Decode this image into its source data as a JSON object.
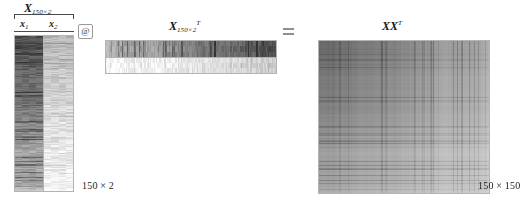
{
  "figure": {
    "kind": "matrix-multiplication-diagram"
  },
  "left_matrix": {
    "name": "X",
    "header_var": "X",
    "header_subscript": "150×2",
    "columns": [
      {
        "var": "x",
        "subscript": "1"
      },
      {
        "var": "x",
        "subscript": "2"
      }
    ],
    "dimension_label": "150 × 2"
  },
  "operators": {
    "matmul": "@",
    "equals": "="
  },
  "middle_matrix": {
    "name": "X^T",
    "header_var": "X",
    "header_subscript": "150×2",
    "header_superscript": "T",
    "rows": 2
  },
  "right_matrix": {
    "name": "XX^T",
    "header_var": "XX",
    "header_superscript": "T",
    "dimension_label": "150 × 150"
  },
  "colors": {
    "ink": "#1a1a1a",
    "border": "#b4b4b4",
    "brace": "#4a4a4a",
    "operator": "#3a3a3a",
    "texture_dark": "#6a6a6a",
    "texture_light": "#f2f2f2"
  }
}
